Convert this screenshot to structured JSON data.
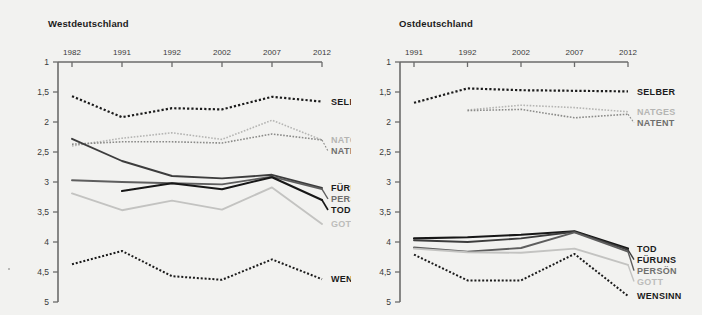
{
  "figure": {
    "background": "#f2f2f0",
    "axis_color": "#6b6b6b",
    "note": "Zwei Liniendiagramme: Westdeutschland und Ostdeutschland"
  },
  "series_styles": {
    "SELBER": {
      "color": "#1b1b1b",
      "dash": "dotted",
      "width": 2.2
    },
    "NATGES": {
      "color": "#b5b5b3",
      "dash": "dotted",
      "width": 1.6
    },
    "NATENT": {
      "color": "#8a8a88",
      "dash": "dotted",
      "width": 1.6
    },
    "FÜRUNS": {
      "color": "#3d3d3d",
      "dash": "solid",
      "width": 1.9
    },
    "PERSÖN": {
      "color": "#5e5e5e",
      "dash": "solid",
      "width": 1.9
    },
    "TOD": {
      "color": "#171717",
      "dash": "solid",
      "width": 2.1
    },
    "GOTT": {
      "color": "#c3c3c1",
      "dash": "solid",
      "width": 1.9
    },
    "WENSINN": {
      "color": "#1b1b1b",
      "dash": "dotted",
      "width": 2.0
    }
  },
  "chart_data": [
    {
      "type": "line",
      "title": "Westdeutschland",
      "xlabel": "",
      "ylabel": "",
      "x": [
        "1982",
        "1991",
        "1992",
        "2002",
        "2007",
        "2012"
      ],
      "ylim": [
        1,
        5
      ],
      "y_inverted": true,
      "yticks": [
        "1",
        "1,5",
        "2",
        "2,5",
        "3",
        "3,5",
        "4",
        "4,5",
        "5"
      ],
      "grid": false,
      "legend_position": "right",
      "series": [
        {
          "name": "SELBER",
          "values": [
            1.57,
            1.92,
            1.77,
            1.79,
            1.58,
            1.66
          ]
        },
        {
          "name": "NATGES",
          "values": [
            2.4,
            2.27,
            2.18,
            2.29,
            1.97,
            2.3
          ]
        },
        {
          "name": "NATENT",
          "values": [
            2.37,
            2.33,
            2.33,
            2.35,
            2.2,
            2.3
          ]
        },
        {
          "name": "FÜRUNS",
          "values": [
            2.28,
            2.65,
            2.9,
            2.94,
            2.88,
            3.1
          ]
        },
        {
          "name": "PERSÖN",
          "values": [
            2.97,
            3.0,
            3.02,
            3.04,
            2.91,
            3.12
          ]
        },
        {
          "name": "TOD",
          "values": [
            null,
            3.15,
            3.02,
            3.12,
            2.92,
            3.3
          ]
        },
        {
          "name": "GOTT",
          "values": [
            3.19,
            3.47,
            3.31,
            3.46,
            3.09,
            3.7
          ]
        },
        {
          "name": "WENSINN",
          "values": [
            4.37,
            4.15,
            4.57,
            4.63,
            4.29,
            4.62
          ]
        }
      ]
    },
    {
      "type": "line",
      "title": "Ostdeutschland",
      "xlabel": "",
      "ylabel": "",
      "x": [
        "1991",
        "1992",
        "2002",
        "2007",
        "2012"
      ],
      "ylim": [
        1,
        5
      ],
      "y_inverted": true,
      "yticks": [
        "1",
        "1,5",
        "2",
        "2,5",
        "3",
        "3,5",
        "4",
        "4,5",
        "5"
      ],
      "grid": false,
      "legend_position": "right",
      "series": [
        {
          "name": "SELBER",
          "values": [
            1.68,
            1.44,
            1.47,
            1.48,
            1.49
          ]
        },
        {
          "name": "NATGES",
          "values": [
            null,
            1.8,
            1.72,
            1.76,
            1.83
          ]
        },
        {
          "name": "NATENT",
          "values": [
            null,
            1.81,
            1.79,
            1.93,
            1.87
          ]
        },
        {
          "name": "TOD",
          "values": [
            3.94,
            3.92,
            3.88,
            3.82,
            4.11
          ]
        },
        {
          "name": "FÜRUNS",
          "values": [
            3.97,
            4.0,
            3.94,
            3.83,
            4.13
          ]
        },
        {
          "name": "PERSÖN",
          "values": [
            4.09,
            4.16,
            4.1,
            3.84,
            4.16
          ]
        },
        {
          "name": "GOTT",
          "values": [
            4.11,
            4.17,
            4.18,
            4.11,
            4.38
          ]
        },
        {
          "name": "WENSINN",
          "values": [
            4.21,
            4.64,
            4.64,
            4.2,
            4.9
          ]
        }
      ]
    }
  ],
  "panels": [
    {
      "title": "Westdeutschland",
      "xticks": [
        "1982",
        "1991",
        "1992",
        "2002",
        "2007",
        "2012"
      ],
      "yticks": [
        "1",
        "1,5",
        "2",
        "2,5",
        "3",
        "3,5",
        "4",
        "4,5",
        "5"
      ],
      "legend": [
        {
          "label": "SELBER",
          "color": "#1b1b1b"
        },
        {
          "label": "NATGES",
          "color": "#b5b5b3"
        },
        {
          "label": "NATENT",
          "color": "#6f6f6d"
        },
        {
          "label": "FÜRUNS",
          "color": "#1b1b1b"
        },
        {
          "label": "PERSÖN",
          "color": "#6f6f6d"
        },
        {
          "label": "TOD",
          "color": "#1b1b1b"
        },
        {
          "label": "GOTT",
          "color": "#bdbdbb"
        },
        {
          "label": "WENSINN",
          "color": "#1b1b1b"
        }
      ]
    },
    {
      "title": "Ostdeutschland",
      "xticks": [
        "1991",
        "1992",
        "2002",
        "2007",
        "2012"
      ],
      "yticks": [
        "1",
        "1,5",
        "2",
        "2,5",
        "3",
        "3,5",
        "4",
        "4,5",
        "5"
      ],
      "legend": [
        {
          "label": "SELBER",
          "color": "#1b1b1b"
        },
        {
          "label": "NATGES",
          "color": "#b5b5b3"
        },
        {
          "label": "NATENT",
          "color": "#6f6f6d"
        },
        {
          "label": "TOD",
          "color": "#1b1b1b"
        },
        {
          "label": "FÜRUNS",
          "color": "#1b1b1b"
        },
        {
          "label": "PERSÖN",
          "color": "#6f6f6d"
        },
        {
          "label": "GOTT",
          "color": "#bdbdbb"
        },
        {
          "label": "WENSINN",
          "color": "#1b1b1b"
        }
      ]
    }
  ]
}
